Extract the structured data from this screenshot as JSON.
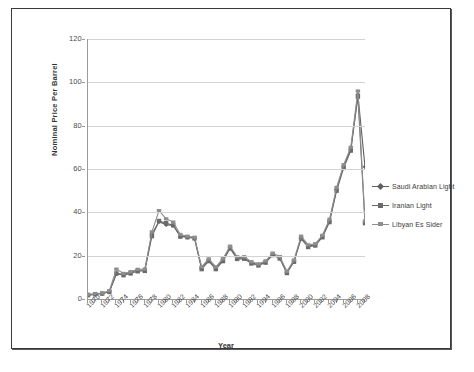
{
  "document": {
    "page_background": "#ffffff",
    "frame_border_color": "#3a3a3a"
  },
  "chart_data": {
    "type": "line",
    "title": "",
    "xlabel": "Year",
    "ylabel": "Nominal Price Per Barrel",
    "xlim": [
      1970,
      2009
    ],
    "ylim": [
      0,
      120
    ],
    "ytick_step": 20,
    "xtick_step": 2,
    "grid": true,
    "legend_position": "right",
    "ytick_labels": [
      "0",
      "20",
      "40",
      "60",
      "80",
      "100",
      "120"
    ],
    "ytick_values": [
      0,
      20,
      40,
      60,
      80,
      100,
      120
    ],
    "xtick_labels": [
      "1970",
      "1972",
      "1974",
      "1976",
      "1978",
      "1980",
      "1982",
      "1984",
      "1986",
      "1988",
      "1990",
      "1992",
      "1994",
      "1996",
      "1998",
      "2000",
      "2002",
      "2004",
      "2006",
      "2008"
    ],
    "xtick_values": [
      1970,
      1972,
      1974,
      1976,
      1978,
      1980,
      1982,
      1984,
      1986,
      1988,
      1990,
      1992,
      1994,
      1996,
      1998,
      2000,
      2002,
      2004,
      2006,
      2008
    ],
    "x": [
      1970,
      1971,
      1972,
      1973,
      1974,
      1975,
      1976,
      1977,
      1978,
      1979,
      1980,
      1981,
      1982,
      1983,
      1984,
      1985,
      1986,
      1987,
      1988,
      1989,
      1990,
      1991,
      1992,
      1993,
      1994,
      1995,
      1996,
      1997,
      1998,
      1999,
      2000,
      2001,
      2002,
      2003,
      2004,
      2005,
      2006,
      2007,
      2008,
      2009
    ],
    "series": [
      {
        "name": "Saudi Arabian Light",
        "marker": "diamond",
        "color": "#5f5f5f",
        "values": [
          1.8,
          2.2,
          2.5,
          3.3,
          11.6,
          11.5,
          12.4,
          13.3,
          13.4,
          30.0,
          35.7,
          34.3,
          34.0,
          29.0,
          28.6,
          28.0,
          14.2,
          18.0,
          14.2,
          18.0,
          23.7,
          19.0,
          19.0,
          16.8,
          15.8,
          17.0,
          20.5,
          19.0,
          12.2,
          17.5,
          28.2,
          24.4,
          25.0,
          28.9,
          36.0,
          50.6,
          61.1,
          69.1,
          94.4,
          61.0
        ]
      },
      {
        "name": "Iranian Light",
        "marker": "square",
        "color": "#6a6a6a",
        "values": [
          1.8,
          2.2,
          2.5,
          3.3,
          11.8,
          11.0,
          11.8,
          12.8,
          13.0,
          29.0,
          36.0,
          35.0,
          34.0,
          28.8,
          28.5,
          28.0,
          13.8,
          17.5,
          13.8,
          17.5,
          23.3,
          18.5,
          18.6,
          16.4,
          15.5,
          16.8,
          20.3,
          18.7,
          12.0,
          17.2,
          27.8,
          24.0,
          24.7,
          28.5,
          35.5,
          50.0,
          60.5,
          68.5,
          93.4,
          35.0
        ]
      },
      {
        "name": "Libyan Es Sider",
        "marker": "dash",
        "color": "#8e8e8e",
        "values": [
          2.2,
          2.4,
          2.8,
          3.8,
          13.8,
          11.8,
          12.6,
          13.7,
          13.8,
          31.0,
          40.8,
          37.0,
          35.5,
          29.8,
          29.0,
          28.5,
          14.8,
          18.5,
          14.8,
          18.6,
          24.4,
          19.5,
          19.5,
          17.2,
          16.2,
          17.6,
          21.2,
          19.6,
          12.8,
          18.0,
          29.0,
          25.0,
          25.5,
          29.4,
          36.8,
          51.5,
          62.0,
          70.0,
          96.0,
          36.0
        ]
      }
    ],
    "notes": {
      "peak_year": 2008,
      "peak_value": 94.4,
      "trough_year": 1998,
      "trough_value": 12.2
    }
  }
}
